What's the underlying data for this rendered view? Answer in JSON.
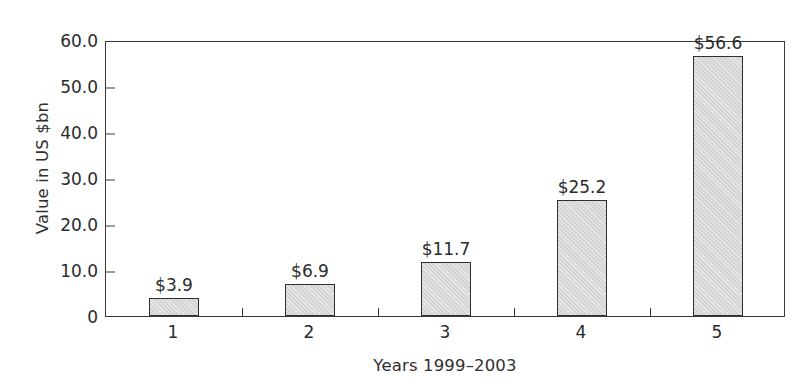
{
  "chart_data": {
    "type": "bar",
    "title": "",
    "subtitle": "",
    "xlabel": "Years 1999–2003",
    "ylabel": "Value in US $bn",
    "categories": [
      "1",
      "2",
      "3",
      "4",
      "5"
    ],
    "values": [
      3.9,
      6.9,
      11.7,
      25.2,
      56.6
    ],
    "data_labels": [
      "$3.9",
      "$6.9",
      "$11.7",
      "$25.2",
      "$56.6"
    ],
    "ylim": [
      0,
      60
    ],
    "ytick_values": [
      0,
      10,
      20,
      30,
      40,
      50,
      60
    ],
    "ytick_labels": [
      "0",
      "10.0",
      "20.0",
      "30.0",
      "40.0",
      "50.0",
      "60.0"
    ],
    "grid": false,
    "legend": null,
    "legend_position": "none",
    "series": [
      {
        "name": "Value in US $bn",
        "values": [
          3.9,
          6.9,
          11.7,
          25.2,
          56.6
        ]
      }
    ],
    "colors": {
      "bar_fill": "#d4d4d4",
      "bar_border": "#2f2f2f",
      "axis": "#3a3a3a",
      "text": "#2b2b2b",
      "background": "#ffffff"
    }
  }
}
